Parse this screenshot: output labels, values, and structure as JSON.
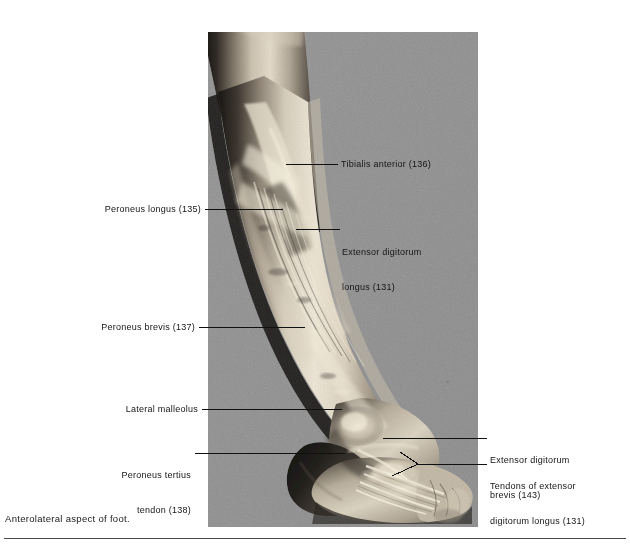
{
  "figure": {
    "caption": "Anterolateral aspect of foot.",
    "plate_background_color": "#8f8f8f",
    "page_background_color": "#ffffff"
  },
  "labels": [
    {
      "id": "tibialis-anterior",
      "side": "right",
      "lines": [
        "Tibialis anterior (136)"
      ],
      "number": "136"
    },
    {
      "id": "extensor-digitorum-longus",
      "side": "right",
      "lines": [
        "Extensor digitorum",
        "longus (131)"
      ],
      "number": "131"
    },
    {
      "id": "extensor-digitorum-brevis",
      "side": "right",
      "lines": [
        "Extensor digitorum",
        "brevis (143)"
      ],
      "number": "143"
    },
    {
      "id": "tendons-of-extensor-digitorum-longus",
      "side": "right",
      "lines": [
        "Tendons of extensor",
        "digitorum longus (131)"
      ],
      "number": "131"
    },
    {
      "id": "peroneus-longus",
      "side": "left",
      "lines": [
        "Peroneus longus (135)"
      ],
      "number": "135"
    },
    {
      "id": "peroneus-brevis",
      "side": "left",
      "lines": [
        "Peroneus brevis (137)"
      ],
      "number": "137"
    },
    {
      "id": "lateral-malleolus",
      "side": "left",
      "lines": [
        "Lateral malleolus"
      ],
      "number": ""
    },
    {
      "id": "peroneus-tertius-tendon",
      "side": "left",
      "lines": [
        "Peroneus tertius",
        "tendon (138)"
      ],
      "number": "138"
    }
  ]
}
